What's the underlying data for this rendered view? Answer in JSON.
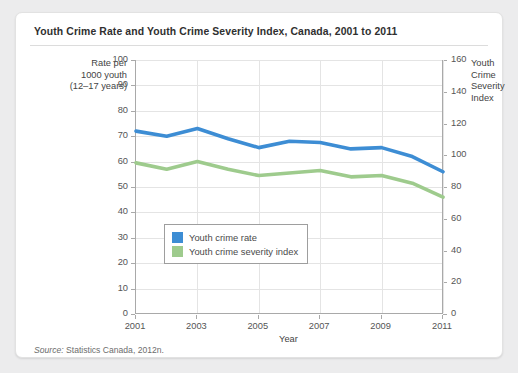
{
  "figure": {
    "title": "Youth Crime Rate and Youth Crime Severity Index, Canada, 2001 to 2011",
    "source_label": "Source:",
    "source_text": " Statistics Canada, 2012n."
  },
  "colors": {
    "youth_crime_rate": "#3d8dd4",
    "youth_crime_severity_index": "#9ecb8d",
    "axis": "#a9a9a9",
    "grid": "#e4e4e4",
    "card": "#ffffff",
    "page_background": "#ececed"
  },
  "chart_data": {
    "type": "line",
    "title": "Youth Crime Rate and Youth Crime Severity Index, Canada, 2001 to 2011",
    "xlabel": "Year",
    "ylabel": "Rate per 1000 youth (12–17 years)",
    "ylabel_right": "Youth Crime Severity Index",
    "x": [
      2001,
      2002,
      2003,
      2004,
      2005,
      2006,
      2007,
      2008,
      2009,
      2010,
      2011
    ],
    "xtick_labels": [
      "2001",
      "2003",
      "2005",
      "2007",
      "2009",
      "2011"
    ],
    "xtick_values": [
      2001,
      2003,
      2005,
      2007,
      2009,
      2011
    ],
    "xlim": [
      2001,
      2011
    ],
    "ylim": [
      0,
      100
    ],
    "ytick_labels": [
      "0",
      "10",
      "20",
      "30",
      "40",
      "50",
      "60",
      "70",
      "80",
      "90",
      "100"
    ],
    "ylim_right": [
      0,
      160
    ],
    "ytick_labels_right": [
      "0",
      "20",
      "40",
      "60",
      "80",
      "100",
      "120",
      "140",
      "160"
    ],
    "grid": true,
    "legend_position": "inside-lower-left",
    "series": [
      {
        "name": "Youth crime rate",
        "axis": "left",
        "color": "#3d8dd4",
        "values": [
          72,
          70,
          73,
          69,
          65.5,
          68,
          67.5,
          65,
          65.5,
          62,
          56
        ]
      },
      {
        "name": "Youth crime severity index",
        "axis": "left",
        "color": "#9ecb8d",
        "values": [
          59.5,
          57,
          60,
          57,
          54.5,
          55.5,
          56.5,
          54,
          54.5,
          51.5,
          46
        ]
      }
    ]
  },
  "legend": {
    "items": [
      {
        "label": "Youth crime rate",
        "color": "#3d8dd4"
      },
      {
        "label": "Youth crime severity index",
        "color": "#9ecb8d"
      }
    ]
  },
  "axis_titles": {
    "left_line1": "Rate per",
    "left_line2": "1000 youth",
    "left_line3": "(12–17 years)",
    "right_line1": "Youth",
    "right_line2": "Crime",
    "right_line3": "Severity",
    "right_line4": "Index",
    "x": "Year"
  }
}
